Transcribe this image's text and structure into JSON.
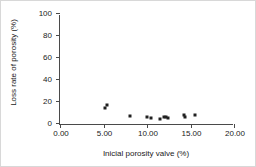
{
  "chart_data": {
    "type": "scatter",
    "title": "",
    "xlabel": "Inicial porosity valve (%)",
    "ylabel": "Loss rate of porosity (%)",
    "xlim": [
      0,
      20
    ],
    "ylim": [
      0,
      100
    ],
    "xticks": [
      0,
      5,
      10,
      15,
      20
    ],
    "xtick_labels": [
      "0.00",
      "5.00",
      "10.00",
      "15.00",
      "20.00"
    ],
    "yticks": [
      0,
      20,
      40,
      60,
      80,
      100
    ],
    "ytick_labels": [
      "0",
      "20",
      "40",
      "60",
      "80",
      "100"
    ],
    "grid": false,
    "legend": false,
    "marker": "filled-square",
    "marker_color": "#202020",
    "series": [
      {
        "name": "porosity loss",
        "points": [
          {
            "x": 5.2,
            "y": 15.0
          },
          {
            "x": 5.4,
            "y": 17.0
          },
          {
            "x": 8.1,
            "y": 7.0
          },
          {
            "x": 10.0,
            "y": 6.0
          },
          {
            "x": 10.45,
            "y": 5.5
          },
          {
            "x": 11.5,
            "y": 5.0
          },
          {
            "x": 11.95,
            "y": 6.0
          },
          {
            "x": 12.15,
            "y": 6.0
          },
          {
            "x": 12.45,
            "y": 5.5
          },
          {
            "x": 14.3,
            "y": 8.0
          },
          {
            "x": 14.4,
            "y": 6.5
          },
          {
            "x": 15.5,
            "y": 8.0
          }
        ]
      }
    ]
  }
}
